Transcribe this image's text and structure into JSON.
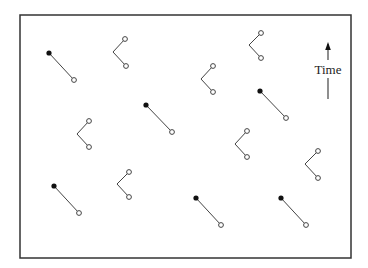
{
  "diagram": {
    "colors": {
      "frame": "#333333",
      "line": "#444444",
      "filled_dot": "#111111",
      "open_dot_stroke": "#444444",
      "background": "#ffffff"
    },
    "frame": {
      "x": 20,
      "y": 15,
      "width": 331,
      "height": 243
    },
    "time_axis": {
      "label": "Time",
      "arrow_x": 328,
      "arrow_head_y": 42,
      "upper_shaft": [
        44,
        60
      ],
      "lower_shaft": [
        78,
        99
      ],
      "label_x": 328,
      "label_y": 69
    },
    "straight_worldlines": [
      {
        "filled": [
          49,
          53
        ],
        "open": [
          74,
          80
        ]
      },
      {
        "filled": [
          146,
          105
        ],
        "open": [
          172,
          132
        ]
      },
      {
        "filled": [
          260,
          91
        ],
        "open": [
          286,
          118
        ]
      },
      {
        "filled": [
          54,
          186
        ],
        "open": [
          79,
          213
        ]
      },
      {
        "filled": [
          196,
          198
        ],
        "open": [
          221,
          225
        ]
      },
      {
        "filled": [
          281,
          198
        ],
        "open": [
          306,
          225
        ]
      }
    ],
    "v_worldlines": [
      {
        "top": [
          125,
          39
        ],
        "vertex": [
          113,
          52
        ],
        "bottom": [
          126,
          66
        ]
      },
      {
        "top": [
          261,
          33
        ],
        "vertex": [
          249,
          45
        ],
        "bottom": [
          261,
          58
        ]
      },
      {
        "top": [
          213,
          66
        ],
        "vertex": [
          201,
          79
        ],
        "bottom": [
          213,
          92
        ]
      },
      {
        "top": [
          89,
          121
        ],
        "vertex": [
          77,
          134
        ],
        "bottom": [
          89,
          147
        ]
      },
      {
        "top": [
          247,
          131
        ],
        "vertex": [
          235,
          144
        ],
        "bottom": [
          247,
          157
        ]
      },
      {
        "top": [
          318,
          151
        ],
        "vertex": [
          305,
          164
        ],
        "bottom": [
          318,
          178
        ]
      },
      {
        "top": [
          129,
          172
        ],
        "vertex": [
          117,
          184
        ],
        "bottom": [
          129,
          197
        ]
      }
    ]
  }
}
